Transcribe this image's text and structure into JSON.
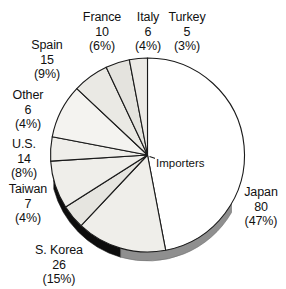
{
  "chart_data": {
    "type": "pie",
    "title": "",
    "center_annotation": "Importers",
    "total": 169,
    "units": "",
    "legend": "none",
    "labels_position": "outside-with-leader-free",
    "start_angle_deg": 0,
    "direction": "clockwise",
    "categories": [
      "Japan",
      "S. Korea",
      "Taiwan",
      "U.S.",
      "Other",
      "Spain",
      "France",
      "Italy",
      "Turkey"
    ],
    "values": [
      80,
      26,
      7,
      14,
      6,
      15,
      10,
      6,
      5
    ],
    "percents": [
      47,
      15,
      4,
      8,
      4,
      9,
      6,
      4,
      3
    ],
    "slices": [
      {
        "name": "Japan",
        "value": 80,
        "percent": 47,
        "value_text": "80",
        "percent_text": "(47%)",
        "fill": "#ffffff"
      },
      {
        "name": "S. Korea",
        "value": 26,
        "percent": 15,
        "value_text": "26",
        "percent_text": "(15%)",
        "fill": "#efeeea"
      },
      {
        "name": "Taiwan",
        "value": 7,
        "percent": 4,
        "value_text": "7",
        "percent_text": "(4%)",
        "fill": "#e6e5e0"
      },
      {
        "name": "U.S.",
        "value": 14,
        "percent": 8,
        "value_text": "14",
        "percent_text": "(8%)",
        "fill": "#efeeea"
      },
      {
        "name": "Other",
        "value": 6,
        "percent": 4,
        "value_text": "6",
        "percent_text": "(4%)",
        "fill": "#efeeea"
      },
      {
        "name": "Spain",
        "value": 15,
        "percent": 9,
        "value_text": "15",
        "percent_text": "(9%)",
        "fill": "#f4f3f0"
      },
      {
        "name": "France",
        "value": 10,
        "percent": 6,
        "value_text": "10",
        "percent_text": "(6%)",
        "fill": "#eae9e4"
      },
      {
        "name": "Italy",
        "value": 6,
        "percent": 4,
        "value_text": "6",
        "percent_text": "(4%)",
        "fill": "#e4e3de"
      },
      {
        "name": "Turkey",
        "value": 5,
        "percent": 3,
        "value_text": "5",
        "percent_text": "(3%)",
        "fill": "#eceae6"
      }
    ],
    "colors": {
      "outline": "#1a1a1a",
      "slice_light": "#efeeea",
      "slice_white": "#ffffff",
      "shadow_dark": "#0d0d0d",
      "shadow_gray": "#8f8f8f",
      "text": "#111111",
      "background": "#ffffff"
    },
    "geometry": {
      "center_x": 147.5,
      "center_y": 155,
      "radius": 97,
      "depth": 9
    }
  },
  "labels": {
    "france": {
      "name": "France",
      "value": "10",
      "percent": "(6%)"
    },
    "italy": {
      "name": "Italy",
      "value": "6",
      "percent": "(4%)"
    },
    "turkey": {
      "name": "Turkey",
      "value": "5",
      "percent": "(3%)"
    },
    "spain": {
      "name": "Spain",
      "value": "15",
      "percent": "(9%)"
    },
    "other": {
      "name": "Other",
      "value": "6",
      "percent": "(4%)"
    },
    "us": {
      "name": "U.S.",
      "value": "14",
      "percent": "(8%)"
    },
    "taiwan": {
      "name": "Taiwan",
      "value": "7",
      "percent": "(4%)"
    },
    "skorea": {
      "name": "S. Korea",
      "value": "26",
      "percent": "(15%)"
    },
    "japan": {
      "name": "Japan",
      "value": "80",
      "percent": "(47%)"
    },
    "importers": "Importers"
  }
}
